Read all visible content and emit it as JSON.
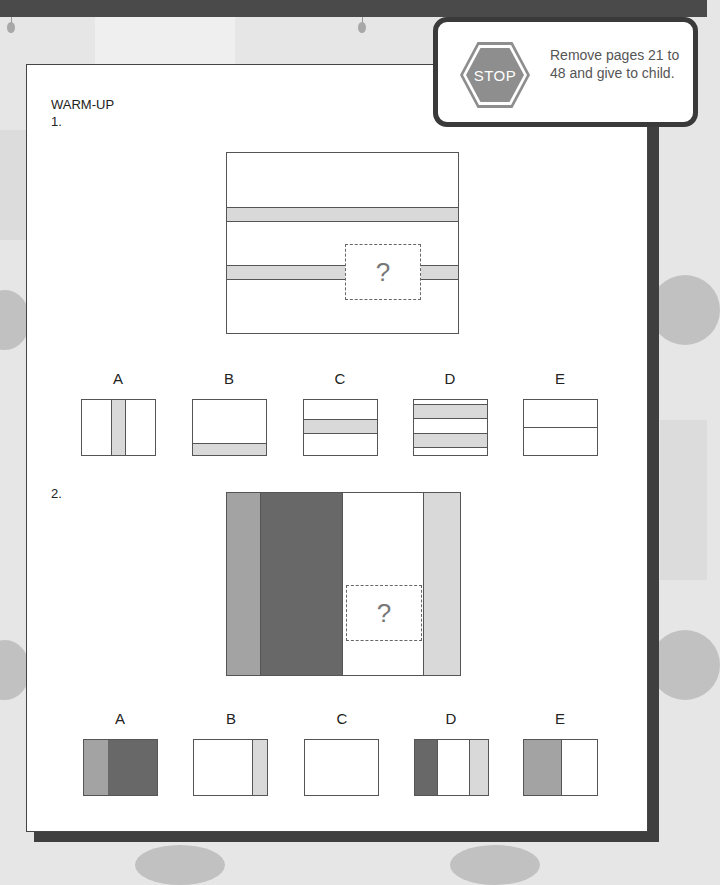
{
  "callout": {
    "stop_sign_text": "STOP",
    "message": "Remove pages 21 to 48 and give to child."
  },
  "section_title": "WARM-UP",
  "colors": {
    "light_gray": "#d9d9d9",
    "mid_gray": "#a3a3a3",
    "dark_gray": "#686868",
    "border": "#555555"
  },
  "questions": [
    {
      "number": "1.",
      "placeholder": "?",
      "options": [
        {
          "letter": "A"
        },
        {
          "letter": "B"
        },
        {
          "letter": "C"
        },
        {
          "letter": "D"
        },
        {
          "letter": "E"
        }
      ]
    },
    {
      "number": "2.",
      "placeholder": "?",
      "options": [
        {
          "letter": "A"
        },
        {
          "letter": "B"
        },
        {
          "letter": "C"
        },
        {
          "letter": "D"
        },
        {
          "letter": "E"
        }
      ]
    }
  ]
}
